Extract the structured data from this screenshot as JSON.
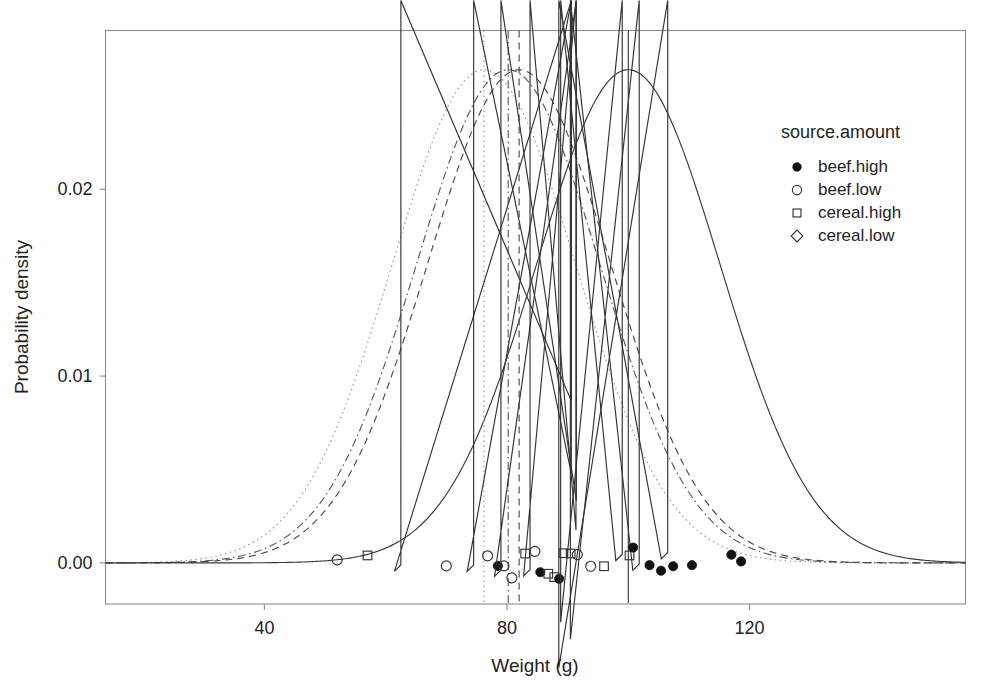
{
  "chart_data": {
    "type": "line",
    "title": "",
    "xlabel": "Weight (g)",
    "ylabel": "Probability density",
    "xlim": [
      13.8,
      155.6
    ],
    "ylim": [
      -0.0022,
      0.0285
    ],
    "xticks": [
      40,
      80,
      120
    ],
    "xtick_labels": [
      "40",
      "80",
      "120"
    ],
    "yticks": [
      0.0,
      0.01,
      0.02
    ],
    "ytick_labels": [
      "0.00",
      "0.01",
      "0.02"
    ],
    "grid": false,
    "legend_position": "top-right",
    "legend_title": "source.amount",
    "series": [
      {
        "name": "cereal.low",
        "label": "cereal.low",
        "linestyle": "dotted",
        "color": "#9a9a9a",
        "mean": 76.2,
        "sd": 15.1,
        "peak_density": 0.0264,
        "marker": "open-diamond",
        "vline_x": 76.2
      },
      {
        "name": "beef.low",
        "label": "beef.low",
        "linestyle": "dashdot",
        "color": "#5a5a5a",
        "mean": 80.2,
        "sd": 15.1,
        "peak_density": 0.0264,
        "marker": "open-circle",
        "vline_x": 80.2
      },
      {
        "name": "cereal.high",
        "label": "cereal.high",
        "linestyle": "dashed",
        "color": "#4a4a4a",
        "mean": 82.0,
        "sd": 15.1,
        "peak_density": 0.0264,
        "marker": "open-square",
        "vline_x": 82.0
      },
      {
        "name": "beef.high",
        "label": "beef.high",
        "linestyle": "solid",
        "color": "#3a3a3a",
        "mean": 100.0,
        "sd": 15.1,
        "peak_density": 0.0264,
        "marker": "filled-circle",
        "vline_x": 100.0
      }
    ],
    "legend_entries": [
      {
        "label": "beef.high",
        "marker": "filled-circle"
      },
      {
        "label": "beef.low",
        "marker": "open-circle"
      },
      {
        "label": "cereal.high",
        "marker": "open-square"
      },
      {
        "label": "cereal.low",
        "marker": "open-diamond"
      }
    ],
    "rug_points": [
      {
        "group": "beef.low",
        "x": 52.0,
        "y": 0.00016
      },
      {
        "group": "cereal.high",
        "x": 57.0,
        "y": 0.0004
      },
      {
        "group": "cereal.low",
        "x": 62.5,
        "y": -0.00045
      },
      {
        "group": "beef.low",
        "x": 70.0,
        "y": -0.00016
      },
      {
        "group": "cereal.low",
        "x": 74.5,
        "y": -0.00045
      },
      {
        "group": "beef.low",
        "x": 76.8,
        "y": 0.00038
      },
      {
        "group": "beef.high",
        "x": 78.5,
        "y": -0.00016
      },
      {
        "group": "beef.low",
        "x": 79.5,
        "y": -0.00016
      },
      {
        "group": "cereal.low",
        "x": 79.0,
        "y": -0.00072
      },
      {
        "group": "beef.low",
        "x": 80.8,
        "y": -0.0008
      },
      {
        "group": "cereal.high",
        "x": 83.0,
        "y": 0.0005
      },
      {
        "group": "beef.low",
        "x": 84.6,
        "y": 0.00062
      },
      {
        "group": "cereal.low",
        "x": 83.8,
        "y": -0.0007
      },
      {
        "group": "beef.high",
        "x": 85.5,
        "y": -0.0005
      },
      {
        "group": "cereal.high",
        "x": 86.8,
        "y": -0.00058
      },
      {
        "group": "cereal.high",
        "x": 87.8,
        "y": -0.00076
      },
      {
        "group": "beef.high",
        "x": 88.6,
        "y": -0.00085
      },
      {
        "group": "cereal.high",
        "x": 89.3,
        "y": 0.00052
      },
      {
        "group": "cereal.high",
        "x": 90.5,
        "y": 0.0005
      },
      {
        "group": "beef.low",
        "x": 91.6,
        "y": 0.00044
      },
      {
        "group": "beef.low",
        "x": 93.8,
        "y": -0.00018
      },
      {
        "group": "cereal.high",
        "x": 96.0,
        "y": -0.00018
      },
      {
        "group": "cereal.low",
        "x": 99.0,
        "y": 0.00012
      },
      {
        "group": "cereal.high",
        "x": 100.2,
        "y": 0.0004
      },
      {
        "group": "cereal.low",
        "x": 101.8,
        "y": -0.0004
      },
      {
        "group": "beef.high",
        "x": 100.8,
        "y": 0.00082
      },
      {
        "group": "beef.high",
        "x": 103.5,
        "y": -0.00012
      },
      {
        "group": "beef.high",
        "x": 105.4,
        "y": -0.00042
      },
      {
        "group": "cereal.low",
        "x": 106.5,
        "y": 0.00022
      },
      {
        "group": "beef.high",
        "x": 107.4,
        "y": -0.00018
      },
      {
        "group": "beef.high",
        "x": 110.5,
        "y": -0.00012
      },
      {
        "group": "beef.high",
        "x": 117.0,
        "y": 0.00044
      },
      {
        "group": "beef.high",
        "x": 118.6,
        "y": 8e-05
      }
    ]
  }
}
